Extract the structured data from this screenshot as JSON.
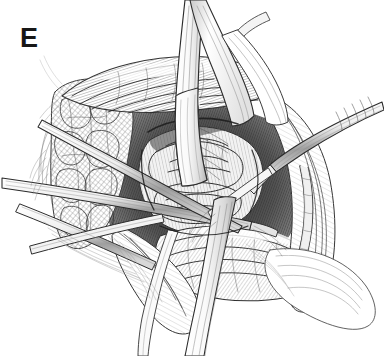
{
  "figure": {
    "panel_label": "E",
    "domain": "medical-surgical-illustration",
    "medium": "pen-and-ink line drawing, black on white",
    "background_color": "#ffffff",
    "ink_color": "#1a1a1a",
    "midtone_color": "#6e6e6e",
    "light_tone_color": "#b8b8b8",
    "shadow_color": "#2b2b2b",
    "width": 384,
    "height": 356,
    "caption": "",
    "annotations": [],
    "elements": [
      {
        "name": "deaver-retractor-blade-upper",
        "label": "Deaver retractor blade descending from upper field"
      },
      {
        "name": "retractor-blade-upper-right",
        "label": "Second retractor blade, upper right"
      },
      {
        "name": "forceps-long-left",
        "label": "Long dissecting forceps entering from left"
      },
      {
        "name": "forceps-lower-left",
        "label": "Second forceps crossing at lower left"
      },
      {
        "name": "forceps-upper-right",
        "label": "Toothed forceps entering from upper right"
      },
      {
        "name": "retractor-blade-lower",
        "label": "Retractor blade passing to lower field"
      },
      {
        "name": "adipose-tissue-left",
        "label": "Cross-hatched subcutaneous fat, left wound edge"
      },
      {
        "name": "muscle-belly-superior",
        "label": "Striated muscle belly, superior margin"
      },
      {
        "name": "deep-structure-central",
        "label": "Exposed deep central structure in wound base"
      },
      {
        "name": "fascia-sheet-right",
        "label": "Retracted fascial sheet, right field"
      },
      {
        "name": "vessel-right",
        "label": "Vessel coursing along right wound edge"
      },
      {
        "name": "wound-shadow",
        "label": "Deep shadow of the operative cavity"
      }
    ]
  }
}
